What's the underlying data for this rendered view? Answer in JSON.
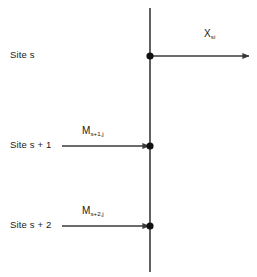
{
  "figure": {
    "background_color": "#ffffff",
    "line_color": "#3a3a3a",
    "text_color": "#1a1a1a",
    "sites": [
      {
        "id": "site-s",
        "label": "Site s",
        "node_y": 56
      },
      {
        "id": "site-s-1",
        "label": "Site s + 1",
        "node_y": 146
      },
      {
        "id": "site-s-2",
        "label": "Site s + 2",
        "node_y": 226
      }
    ],
    "flows": [
      {
        "id": "x-si",
        "symbol": "X",
        "subscript": "si",
        "direction": "outgoing-right",
        "from_x": 150,
        "to_x": 250,
        "y": 56
      },
      {
        "id": "m-s-1-j",
        "symbol": "M",
        "subscript": "s+1,j",
        "direction": "incoming-right",
        "from_x": 62,
        "to_x": 150,
        "y": 146
      },
      {
        "id": "m-s-2-j",
        "symbol": "M",
        "subscript": "s+2,j",
        "direction": "incoming-right",
        "from_x": 62,
        "to_x": 150,
        "y": 226
      }
    ],
    "axis": {
      "id": "vertical-site-axis",
      "x": 150,
      "y_top": 8,
      "y_bottom": 272
    }
  }
}
